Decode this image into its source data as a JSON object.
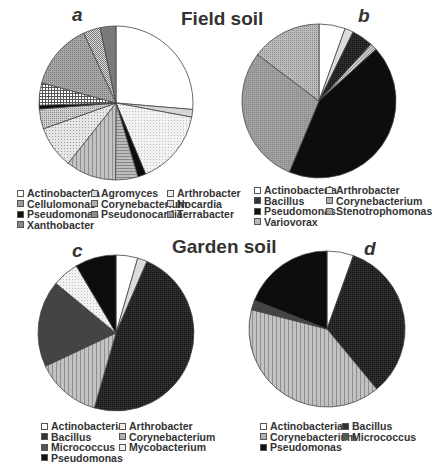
{
  "titles": {
    "top": "Field soil",
    "bottom": "Garden soil"
  },
  "panels": {
    "a": "a",
    "b": "b",
    "c": "c",
    "d": "d"
  },
  "chart_data": [
    {
      "type": "pie",
      "panel": "a",
      "group": "Field soil",
      "categories": [
        "Actinobacteria",
        "Agromyces",
        "Arthrobacter",
        "Pseudomonas",
        "Corynebacterium",
        "Terrabacter",
        "Nocardia",
        "Cellulomonas",
        "Pseudomonas-2",
        "Pseudonocardia",
        "Cellulomonas-2",
        "Nocardia-2",
        "Xanthobacter"
      ],
      "legend": [
        "Actinobacteria",
        "Agromyces",
        "Arthrobacter",
        "Cellulomonas",
        "Corynebacterium",
        "Nocardia",
        "Pseudomonas",
        "Pseudonocardia",
        "Terrabacter",
        "Xanthobacter"
      ],
      "values": [
        26.4,
        1.6,
        15.8,
        1.7,
        4.7,
        10.6,
        8.9,
        4.2,
        0.8,
        4.7,
        13.9,
        3.6,
        3.3
      ],
      "fills": [
        "white",
        "lightgray",
        "dots-light",
        "black",
        "hstripe",
        "vstripe",
        "dots-light2",
        "dots-mid",
        "black",
        "crosshatch",
        "dots-gray",
        "check",
        "darkgray"
      ]
    },
    {
      "type": "pie",
      "panel": "b",
      "group": "Field soil",
      "categories": [
        "Actinobacteria",
        "Arthrobacter",
        "Bacillus",
        "Stenotrophomonas",
        "Pseudomonas",
        "Corynebacterium",
        "Variovorax"
      ],
      "legend": [
        "Actinobacteria",
        "Arthrobacter",
        "Bacillus",
        "Corynebacterium",
        "Pseudomonas",
        "Stenotrophomonas",
        "Variovorax"
      ],
      "values": [
        5.5,
        1.8,
        4.5,
        1.5,
        43.0,
        29.0,
        14.7
      ],
      "fills": [
        "white",
        "lightgray2",
        "darkdots",
        "diag",
        "black",
        "gray-dots",
        "dots-gray2"
      ]
    },
    {
      "type": "pie",
      "panel": "c",
      "group": "Garden soil",
      "categories": [
        "Actinobacteria",
        "Arthrobacter",
        "Bacillus",
        "Corynebacterium",
        "Micrococcus",
        "Mycobacterium",
        "Pseudomonas"
      ],
      "legend": [
        "Actinobacteria",
        "Arthrobacter",
        "Bacillus",
        "Corynebacterium",
        "Micrococcus",
        "Mycobacterium",
        "Pseudomonas"
      ],
      "values": [
        4.5,
        2.0,
        48.0,
        13.5,
        18.0,
        5.5,
        8.5
      ],
      "fills": [
        "white",
        "lightgray2",
        "darkdots",
        "vstripe",
        "darkgray2",
        "dots-light",
        "black"
      ]
    },
    {
      "type": "pie",
      "panel": "d",
      "group": "Garden soil",
      "categories": [
        "Actinobacteria",
        "Bacillus",
        "Corynebacterium",
        "Micrococcus",
        "Pseudomonas"
      ],
      "legend": [
        "Actinobacteria",
        "Bacillus",
        "Corynebacterium",
        "Micrococcus",
        "Pseudomonas"
      ],
      "values": [
        5.5,
        33.5,
        40.0,
        2.0,
        19.0
      ],
      "fills": [
        "white",
        "darkdots",
        "vstripe",
        "darkgray2",
        "black"
      ]
    }
  ],
  "legends": {
    "a": [
      [
        "Actinobacteria",
        "Agromyces",
        "Arthrobacter"
      ],
      [
        "Cellulomonas",
        "Corynebacterium",
        "Nocardia"
      ],
      [
        "Pseudomonas",
        "Pseudonocardia",
        "Terrabacter"
      ],
      [
        "Xanthobacter"
      ]
    ],
    "b": [
      [
        "Actinobacteria",
        "Arthrobacter"
      ],
      [
        "Bacillus",
        "Corynebacterium"
      ],
      [
        "Pseudomonas",
        "Stenotrophomonas"
      ],
      [
        "Variovorax"
      ]
    ],
    "c": [
      [
        "Actinobacteria",
        "Arthrobacter"
      ],
      [
        "Bacillus",
        "Corynebacterium"
      ],
      [
        "Micrococcus",
        "Mycobacterium"
      ],
      [
        "Pseudomonas"
      ]
    ],
    "d": [
      [
        "Actinobacteria",
        "Bacillus"
      ],
      [
        "Corynebacterium",
        "Micrococcus"
      ],
      [
        "Pseudomonas"
      ]
    ]
  },
  "swatches": {
    "Actinobacteria": "#ffffff",
    "Agromyces": "#d9d9d9",
    "Arthrobacter": "#ececec",
    "Cellulomonas": "#9a9a9a",
    "Corynebacterium": "#b0b0b0",
    "Nocardia": "#dcdcdc",
    "Pseudomonas": "#111111",
    "Pseudonocardia": "#8c8c8c",
    "Terrabacter": "#9c9c9c",
    "Xanthobacter": "#888888",
    "Bacillus": "#333333",
    "Stenotrophomonas": "#a8a8a8",
    "Variovorax": "#b8b8b8",
    "Micrococcus": "#555555",
    "Mycobacterium": "#eeeeee"
  }
}
